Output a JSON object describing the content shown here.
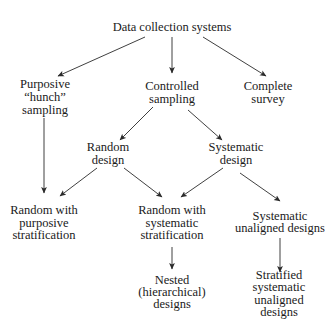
{
  "diagram": {
    "title": "Data collection systems",
    "colors": {
      "text": "#1a1a1a",
      "arrow": "#2a2a2a",
      "background": "#ffffff"
    },
    "nodes": {
      "root": {
        "lines": [
          "Data collection systems"
        ]
      },
      "purposive": {
        "lines": [
          "Purposive",
          "“hunch”",
          "sampling"
        ]
      },
      "controlled": {
        "lines": [
          "Controlled",
          "sampling"
        ]
      },
      "complete": {
        "lines": [
          "Complete",
          "survey"
        ]
      },
      "random_design": {
        "lines": [
          "Random",
          "design"
        ]
      },
      "systematic_design": {
        "lines": [
          "Systematic",
          "design"
        ]
      },
      "random_purposive": {
        "lines": [
          "Random with",
          "purposive",
          "stratification"
        ]
      },
      "random_systematic": {
        "lines": [
          "Random with",
          "systematic",
          "stratification"
        ]
      },
      "systematic_unaligned": {
        "lines": [
          "Systematic",
          "unaligned designs"
        ]
      },
      "nested": {
        "lines": [
          "Nested",
          "(hierarchical)",
          "designs"
        ]
      },
      "stratified_systematic_unaligned": {
        "lines": [
          "Stratified",
          "systematic",
          "unaligned",
          "designs"
        ]
      }
    },
    "edges": [
      {
        "from": "root",
        "to": "purposive"
      },
      {
        "from": "root",
        "to": "controlled"
      },
      {
        "from": "root",
        "to": "complete"
      },
      {
        "from": "purposive",
        "to": "random_purposive"
      },
      {
        "from": "controlled",
        "to": "random_design"
      },
      {
        "from": "controlled",
        "to": "systematic_design"
      },
      {
        "from": "random_design",
        "to": "random_purposive"
      },
      {
        "from": "random_design",
        "to": "random_systematic"
      },
      {
        "from": "systematic_design",
        "to": "random_systematic"
      },
      {
        "from": "systematic_design",
        "to": "systematic_unaligned"
      },
      {
        "from": "random_systematic",
        "to": "nested"
      },
      {
        "from": "systematic_unaligned",
        "to": "stratified_systematic_unaligned"
      }
    ]
  }
}
